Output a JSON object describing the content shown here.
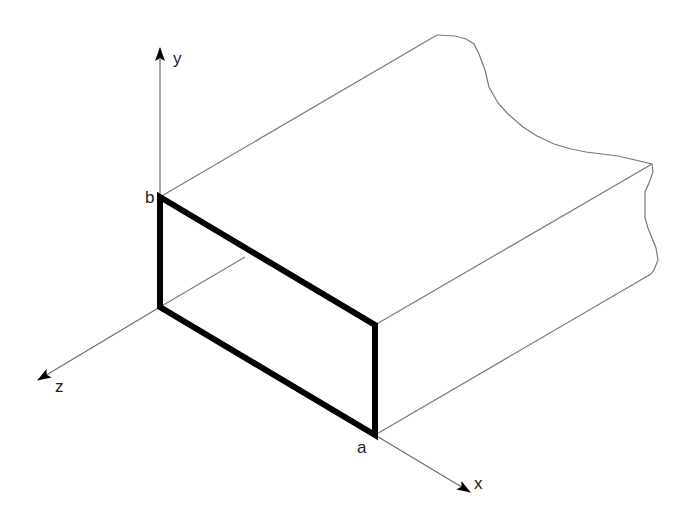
{
  "figure": {
    "labels": {
      "y_axis": "y",
      "x_axis": "x",
      "z_axis": "z",
      "width": "a",
      "height": "b"
    },
    "colors": {
      "cross_section": "#000000",
      "edges": "#7a7a7a",
      "background": "#ffffff"
    }
  }
}
